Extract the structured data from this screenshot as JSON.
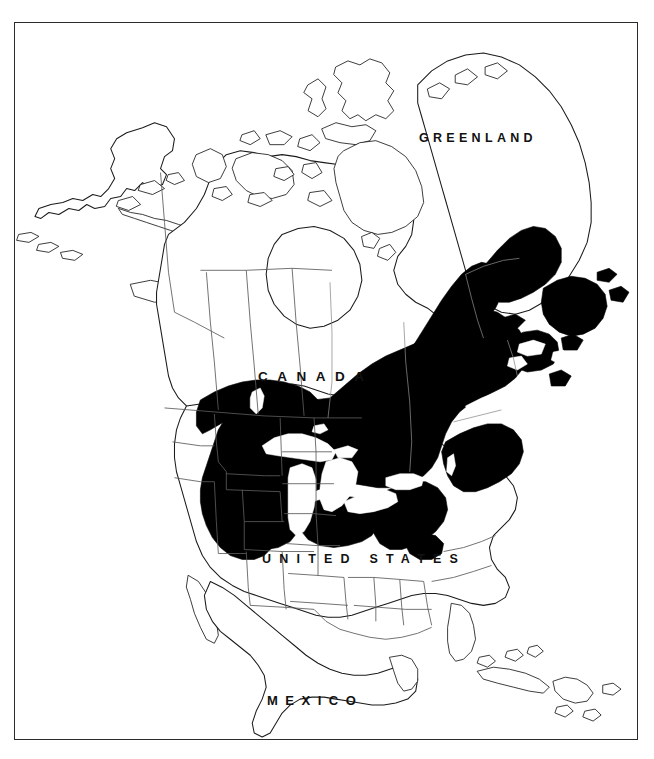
{
  "figure": {
    "type": "species-distribution-map",
    "region": "North America",
    "frame": {
      "border_color": "#2b2b2b",
      "background": "#ffffff"
    }
  },
  "labels": {
    "greenland": "GREENLAND",
    "canada": "CANADA",
    "united_states": "UNITED STATES",
    "mexico": "MEXICO"
  },
  "legend": {
    "range_fill_color": "#000000",
    "land_fill_color": "#ffffff",
    "coastline_color": "#1a1a1a",
    "boundary_color": "#555555"
  },
  "map_data": {
    "type": "choropleth-range",
    "projection": "conic",
    "shaded_range_description": "Solid black distribution range covering the Great Lakes region, northeastern United States, southeastern Canada, Labrador and Newfoundland",
    "range_regions": [
      "Southern Manitoba",
      "Ontario",
      "Quebec",
      "Labrador",
      "Newfoundland",
      "New Brunswick",
      "Nova Scotia",
      "Prince Edward Island",
      "Minnesota",
      "Wisconsin",
      "Michigan",
      "Iowa",
      "Illinois",
      "Indiana",
      "Ohio",
      "Kentucky",
      "West Virginia",
      "Pennsylvania",
      "New York",
      "New Jersey",
      "Maryland",
      "Virginia",
      "Connecticut",
      "Rhode Island",
      "Massachusetts",
      "Vermont",
      "New Hampshire",
      "Maine"
    ],
    "unshaded_features": [
      "Hudson Bay",
      "Lake Superior",
      "Lake Michigan",
      "Lake Huron",
      "Lake Erie",
      "Lake Ontario",
      "Greenland",
      "Alaska",
      "Western Canada",
      "Western United States",
      "Southeastern United States",
      "Mexico",
      "Cuba",
      "Hispaniola"
    ],
    "great_lakes": [
      "Lake Superior",
      "Lake Michigan",
      "Lake Huron",
      "Lake Erie",
      "Lake Ontario"
    ]
  }
}
